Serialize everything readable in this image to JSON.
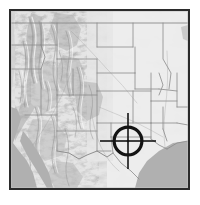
{
  "widget": {
    "name": "location-overview-map",
    "title": "Shaded relief locator map of the western United States",
    "background_color": "#ffffff"
  },
  "frame": {
    "border_color": "#2b2b2b",
    "border_width_px": 2,
    "x": 9,
    "y": 9,
    "width": 181,
    "height": 181
  },
  "map": {
    "style": "grayscale-shaded-relief",
    "region_label": "Western and Central United States",
    "land_base_color": "#dcdcdc",
    "lowland_color": "#e8e8e8",
    "highland_color": "#f4f4f4",
    "shadow_color": "#8d8d8d",
    "water_color": "#b0b0b0",
    "boundary_color": "#8a8a8a",
    "water_bodies": [
      {
        "name": "pacific-ocean",
        "label": "Pacific Ocean",
        "position": "lower-left"
      },
      {
        "name": "gulf-of-mexico",
        "label": "Gulf of Mexico",
        "position": "lower-right"
      },
      {
        "name": "gulf-of-california",
        "label": "Gulf of California",
        "position": "left-lower"
      }
    ],
    "terrain_regions": [
      {
        "name": "sierra-nevada",
        "label": "Sierra Nevada",
        "relief": "high"
      },
      {
        "name": "cascade-range",
        "label": "Cascade Range",
        "relief": "high"
      },
      {
        "name": "great-basin",
        "label": "Great Basin",
        "relief": "medium"
      },
      {
        "name": "rocky-mountains",
        "label": "Rocky Mountains",
        "relief": "high"
      },
      {
        "name": "colorado-plateau",
        "label": "Colorado Plateau",
        "relief": "medium"
      },
      {
        "name": "great-plains",
        "label": "Great Plains",
        "relief": "low"
      }
    ],
    "state_boundaries_visible": true
  },
  "marker": {
    "type": "crosshair-target",
    "label": "Selected location",
    "color": "#141414",
    "center_x_px": 128,
    "center_y_px": 141,
    "ring_outer_radius_px": 15.5,
    "ring_stroke_px": 3.2,
    "center_dot_radius_px": 1.3,
    "tick_extent_px": 28,
    "tick_stroke_px": 1.6
  }
}
